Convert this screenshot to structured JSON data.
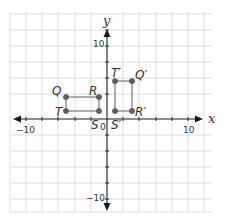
{
  "diagram": {
    "type": "coordinate-plane",
    "axes": {
      "x_label": "x",
      "y_label": "y",
      "x_range": [
        -12,
        12
      ],
      "y_range": [
        -12,
        12
      ],
      "grid_step": 2,
      "tick_labels": {
        "x_neg": "−10",
        "x_pos": "10",
        "y_pos": "10",
        "y_neg": "−10",
        "origin": "0"
      }
    },
    "rectangles": [
      {
        "name": "QRST",
        "vertices": [
          {
            "label": "Q",
            "x": -5,
            "y": 3
          },
          {
            "label": "R",
            "x": -1,
            "y": 3
          },
          {
            "label": "S",
            "x": -1,
            "y": 1
          },
          {
            "label": "T",
            "x": -5,
            "y": 1
          }
        ]
      },
      {
        "name": "Q'R'S'T'",
        "vertices": [
          {
            "label": "T'",
            "x": 1,
            "y": 5
          },
          {
            "label": "Q'",
            "x": 3,
            "y": 5
          },
          {
            "label": "R'",
            "x": 3,
            "y": 1
          },
          {
            "label": "S'",
            "x": 1,
            "y": 1
          }
        ]
      }
    ],
    "labels": {
      "Q": "Q",
      "R": "R",
      "S": "S",
      "T": "T",
      "Qp": "Q′",
      "Rp": "R′",
      "Sp": "S′",
      "Tp": "T′"
    },
    "colors": {
      "grid": "#d4d4d4",
      "axis": "#1a1a1a",
      "shape": "#8a8a8a",
      "point": "#5f5f5f"
    }
  }
}
